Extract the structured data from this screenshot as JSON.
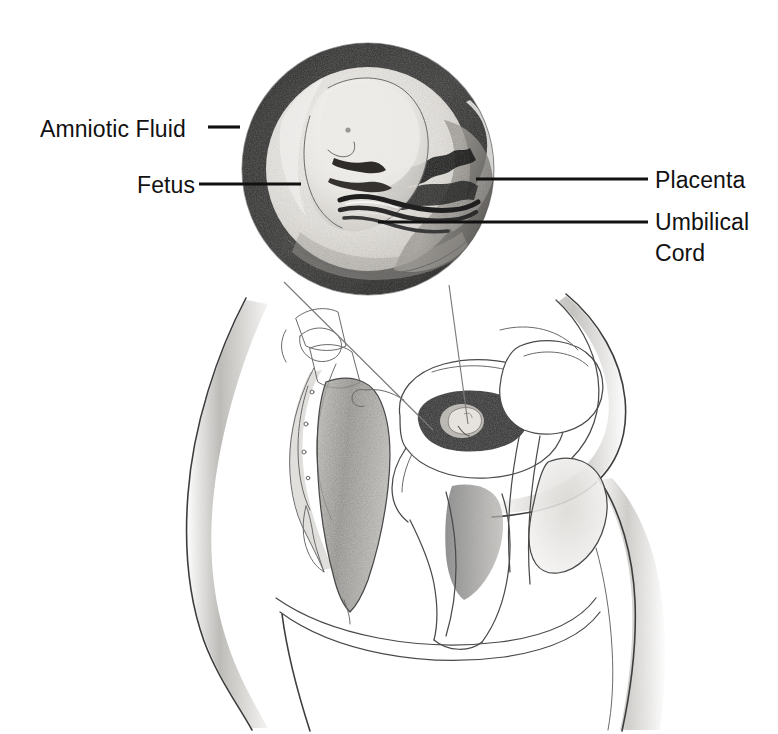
{
  "figure": {
    "background_color": "#ffffff",
    "ink_color": "#111111",
    "width": 778,
    "height": 734
  },
  "labels": [
    {
      "id": "amniotic-fluid",
      "text": "Amniotic Fluid",
      "lines": [
        "Amniotic Fluid"
      ],
      "side": "left",
      "text_x": 40,
      "text_y": 137,
      "leader": {
        "x1": 208,
        "y1": 127,
        "x2": 240,
        "y2": 127
      }
    },
    {
      "id": "fetus",
      "text": "Fetus",
      "lines": [
        "Fetus"
      ],
      "side": "left",
      "text_x": 137,
      "text_y": 193,
      "leader": {
        "x1": 199,
        "y1": 184,
        "x2": 301,
        "y2": 184
      }
    },
    {
      "id": "placenta",
      "text": "Placenta",
      "lines": [
        "Placenta"
      ],
      "side": "right",
      "text_x": 655,
      "text_y": 188,
      "leader": {
        "x1": 476,
        "y1": 179,
        "x2": 648,
        "y2": 179
      }
    },
    {
      "id": "umbilical-cord",
      "text": "Umbilical Cord",
      "lines": [
        "Umbilical",
        "Cord"
      ],
      "side": "right",
      "text_x": 655,
      "text_y": 230,
      "line_height": 31,
      "leader": {
        "x1": 378,
        "y1": 222,
        "x2": 648,
        "y2": 222
      }
    }
  ],
  "inset": {
    "id": "magnified-uterus-inset",
    "shape": "circle",
    "center_x": 368,
    "center_y": 169,
    "radius": 126,
    "description": "Magnified cross-section of the uterus showing the fetus surrounded by amniotic fluid, with the placenta and umbilical cord",
    "rim_color": "#2a2a2a",
    "fluid_color": "#d8d6d2",
    "fetus_color": "#e9e7e3",
    "placenta_color": "#9b9894"
  },
  "cone": {
    "id": "magnification-cone",
    "description": "Two thin lines connecting the magnified inset circle to the uterus in the body section",
    "left_line": {
      "x1": 284,
      "y1": 282,
      "x2": 433,
      "y2": 430
    },
    "right_line": {
      "x1": 449,
      "y1": 285,
      "x2": 468,
      "y2": 424
    }
  },
  "body_section": {
    "id": "pelvic-sagittal-section",
    "view": "sagittal section of the female lower torso",
    "structures": [
      {
        "id": "torso-outline",
        "name": "Torso and thigh outline",
        "shading": "#9d9d9d"
      },
      {
        "id": "sacrum-spine",
        "name": "Sacrum and coccyx",
        "shading": "#777777"
      },
      {
        "id": "rectum",
        "name": "Rectum",
        "shading": "#8b8b8b"
      },
      {
        "id": "uterus",
        "name": "Uterus containing fetus",
        "shading": "#2f2f2f"
      },
      {
        "id": "bladder",
        "name": "Urinary bladder",
        "shading": "#ffffff"
      },
      {
        "id": "vagina",
        "name": "Vagina",
        "shading": "#6f6f6f"
      },
      {
        "id": "pubic-bone",
        "name": "Pubic symphysis",
        "shading": "#c9c7c3"
      },
      {
        "id": "abdominal-wall",
        "name": "Anterior abdominal wall",
        "shading": "#b5b5b5"
      }
    ]
  }
}
